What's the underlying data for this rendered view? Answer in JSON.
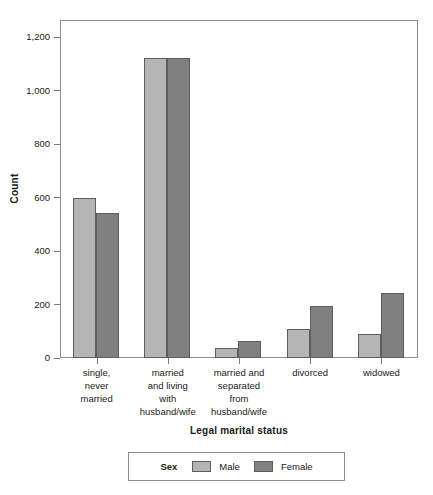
{
  "chart_data": {
    "type": "bar",
    "title": "",
    "xlabel": "Legal marital status",
    "ylabel": "Count",
    "categories": [
      "single,\nnever\nmarried",
      "married\nand living\nwith\nhusband/wife",
      "married and\nseparated\nfrom\nhusband/wife",
      "divorced",
      "widowed"
    ],
    "series": [
      {
        "name": "Male",
        "color": "#b5b5b5",
        "values": [
          598,
          1120,
          37,
          110,
          88
        ]
      },
      {
        "name": "Female",
        "color": "#808080",
        "values": [
          543,
          1120,
          62,
          194,
          242
        ]
      }
    ],
    "ylim": [
      0,
      1260
    ],
    "yticks": [
      0,
      200,
      400,
      600,
      800,
      1000,
      1200
    ],
    "ytick_labels": [
      "0",
      "200",
      "400",
      "600",
      "800",
      "1,000",
      "1,200"
    ],
    "grid": false,
    "legend_position": "bottom",
    "legend_title": "Sex"
  },
  "axes": {
    "y_title": "Count",
    "x_title": "Legal marital status"
  },
  "categories": [
    {
      "lines": [
        "single,",
        "never",
        "married"
      ]
    },
    {
      "lines": [
        "married",
        "and living",
        "with",
        "husband/wife"
      ]
    },
    {
      "lines": [
        "married and",
        "separated",
        "from",
        "husband/wife"
      ]
    },
    {
      "lines": [
        "divorced"
      ]
    },
    {
      "lines": [
        "widowed"
      ]
    }
  ],
  "legend": {
    "title": "Sex",
    "items": [
      {
        "label": "Male",
        "color": "#b5b5b5"
      },
      {
        "label": "Female",
        "color": "#808080"
      }
    ]
  },
  "colors": {
    "male": "#b5b5b5",
    "female": "#808080",
    "bar_border": "#5d5d5d",
    "frame": "#8d8d8d",
    "background": "#ffffff",
    "text": "#1a1a1a"
  }
}
